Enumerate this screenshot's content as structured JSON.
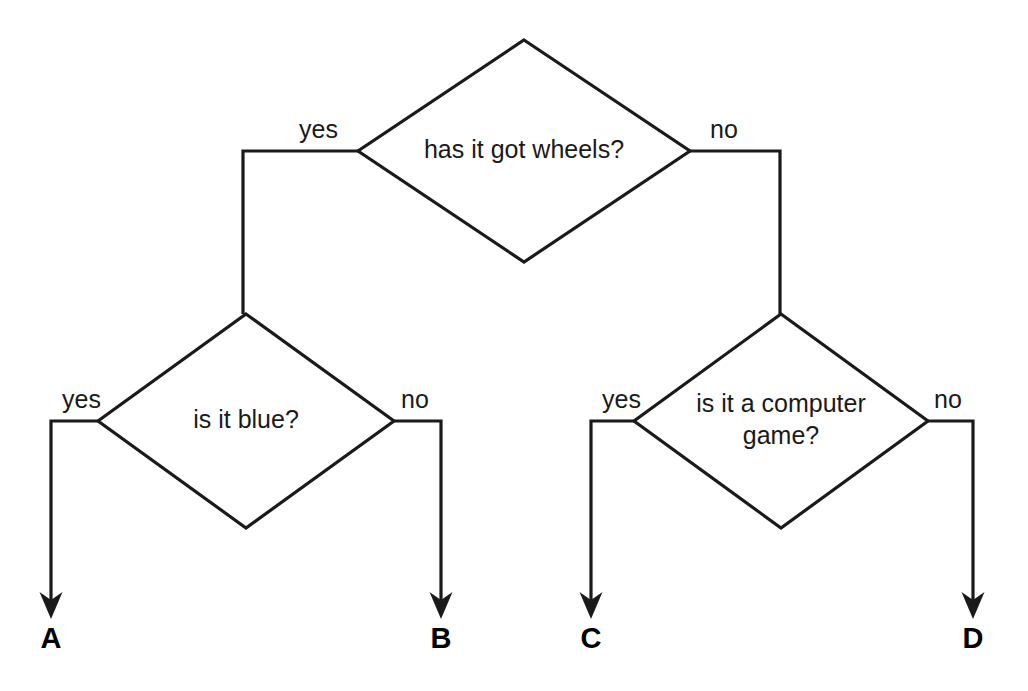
{
  "diagram": {
    "type": "decision-tree-flowchart",
    "title": "has it got wheels?",
    "background_color": "#ffffff",
    "line_color": "#1a1a1a",
    "text_color": "#1a1a1a",
    "nodes": [
      {
        "id": "q-wheels",
        "shape": "diamond",
        "text": "has it got wheels?",
        "lines": [
          "has it got wheels?"
        ],
        "cx": 524,
        "cy": 151,
        "rx": 166,
        "ry": 111
      },
      {
        "id": "q-blue",
        "shape": "diamond",
        "text": "is it blue?",
        "lines": [
          "is it blue?"
        ],
        "cx": 246,
        "cy": 421,
        "rx": 148,
        "ry": 107
      },
      {
        "id": "q-computer-game",
        "shape": "diamond",
        "text": "is it a computer game?",
        "lines": [
          "is it a computer",
          "game?"
        ],
        "cx": 781,
        "cy": 421,
        "rx": 147,
        "ry": 107
      }
    ],
    "edges": [
      {
        "id": "edge-wheels-yes",
        "from": "q-wheels",
        "to": "q-blue",
        "label": "yes",
        "label_x": 338,
        "label_y": 138,
        "label_anchor": "end",
        "path": "M 358 151 L 243 151 L 243 314"
      },
      {
        "id": "edge-wheels-no",
        "from": "q-wheels",
        "to": "q-computer-game",
        "label": "no",
        "label_x": 710,
        "label_y": 138,
        "label_anchor": "start",
        "path": "M 690 151 L 780 151 L 780 314"
      },
      {
        "id": "edge-blue-yes",
        "from": "q-blue",
        "to": "terminal-a",
        "label": "yes",
        "label_x": 101,
        "label_y": 408,
        "label_anchor": "end",
        "path": "M 98 421 L 51 421 L 51 600"
      },
      {
        "id": "edge-blue-no",
        "from": "q-blue",
        "to": "terminal-b",
        "label": "no",
        "label_x": 401,
        "label_y": 408,
        "label_anchor": "start",
        "path": "M 394 421 L 441 421 L 441 600"
      },
      {
        "id": "edge-game-yes",
        "from": "q-computer-game",
        "to": "terminal-c",
        "label": "yes",
        "label_x": 641,
        "label_y": 408,
        "label_anchor": "end",
        "path": "M 634 421 L 591 421 L 591 600"
      },
      {
        "id": "edge-game-no",
        "from": "q-computer-game",
        "to": "terminal-d",
        "label": "no",
        "label_x": 934,
        "label_y": 408,
        "label_anchor": "start",
        "path": "M 928 421 L 973 421 L 973 600"
      }
    ],
    "terminals": [
      {
        "id": "terminal-a",
        "label": "A",
        "x": 51,
        "y": 648,
        "arrow_tip_y": 619
      },
      {
        "id": "terminal-b",
        "label": "B",
        "x": 441,
        "y": 648,
        "arrow_tip_y": 619
      },
      {
        "id": "terminal-c",
        "label": "C",
        "x": 591,
        "y": 648,
        "arrow_tip_y": 619
      },
      {
        "id": "terminal-d",
        "label": "D",
        "x": 973,
        "y": 648,
        "arrow_tip_y": 619
      }
    ]
  }
}
